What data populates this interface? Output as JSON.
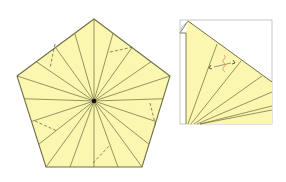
{
  "colors": {
    "paper_fill": "#fbf7b0",
    "crease": "#7a7a4a",
    "edge": "#6f6f45",
    "frame": "#b8b8b8",
    "mark": "#e0a070",
    "center_dot": "#111111"
  },
  "pentagon": {
    "center": [
      94,
      101
    ],
    "vertices": [
      [
        94,
        19
      ],
      [
        170,
        76
      ],
      [
        142,
        167
      ],
      [
        46,
        167
      ],
      [
        17,
        76
      ]
    ],
    "radial_count": 20,
    "dashed_segments": [
      [
        [
          55,
          44
        ],
        [
          50,
          68
        ]
      ],
      [
        [
          110,
          52
        ],
        [
          133,
          47
        ]
      ],
      [
        [
          150,
          103
        ],
        [
          156,
          127
        ]
      ],
      [
        [
          35,
          121
        ],
        [
          57,
          131
        ]
      ],
      [
        [
          93,
          163
        ],
        [
          110,
          145
        ]
      ]
    ]
  },
  "detail": {
    "frame": {
      "x": 180,
      "y": 20,
      "w": 92,
      "h": 104
    },
    "fold_corner": [
      [
        188,
        21
      ],
      [
        180,
        33
      ],
      [
        186,
        33
      ],
      [
        186,
        124
      ]
    ],
    "hypotenuse": [
      [
        188,
        21
      ],
      [
        272,
        82
      ]
    ],
    "fan_origin": [
      186,
      124
    ],
    "fan_targets": [
      [
        217,
        44
      ],
      [
        241,
        61
      ],
      [
        262,
        76
      ],
      [
        272,
        92
      ],
      [
        272,
        110
      ]
    ],
    "arrow_marks": [
      [
        211,
        68
      ],
      [
        234,
        63
      ]
    ],
    "label_glyph": "≀"
  }
}
